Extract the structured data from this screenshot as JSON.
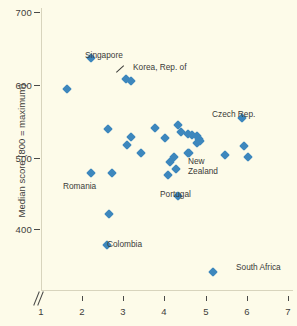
{
  "chart_data": {
    "type": "scatter",
    "title": "",
    "xlabel": "",
    "ylabel": "Median score (800 = maximum)",
    "xlim": [
      1,
      7
    ],
    "ylim": [
      330,
      700
    ],
    "grid": false,
    "legend": "none",
    "axis_break_x": true,
    "xticks": [
      1,
      2,
      3,
      4,
      5,
      6,
      7
    ],
    "yticks": [
      400,
      500,
      600,
      700
    ],
    "marker_color": "#3d87bd",
    "background_color": "#fdfbe9",
    "points": [
      {
        "x": 1.62,
        "y": 593,
        "label": ""
      },
      {
        "x": 2.22,
        "y": 637,
        "label": "Singapore"
      },
      {
        "x": 3.06,
        "y": 607,
        "label": "Korea, Rep. of"
      },
      {
        "x": 3.18,
        "y": 605,
        "label": ""
      },
      {
        "x": 5.88,
        "y": 553,
        "label": "Czech Rep."
      },
      {
        "x": 4.33,
        "y": 544,
        "label": ""
      },
      {
        "x": 3.78,
        "y": 539,
        "label": ""
      },
      {
        "x": 2.63,
        "y": 538,
        "label": ""
      },
      {
        "x": 4.41,
        "y": 534,
        "label": ""
      },
      {
        "x": 4.57,
        "y": 531,
        "label": ""
      },
      {
        "x": 4.67,
        "y": 530,
        "label": ""
      },
      {
        "x": 4.8,
        "y": 528,
        "label": ""
      },
      {
        "x": 4.83,
        "y": 524,
        "label": ""
      },
      {
        "x": 4.86,
        "y": 521,
        "label": ""
      },
      {
        "x": 3.18,
        "y": 527,
        "label": ""
      },
      {
        "x": 4.02,
        "y": 526,
        "label": ""
      },
      {
        "x": 4.78,
        "y": 519,
        "label": ""
      },
      {
        "x": 5.92,
        "y": 515,
        "label": ""
      },
      {
        "x": 3.1,
        "y": 516,
        "label": ""
      },
      {
        "x": 3.42,
        "y": 505,
        "label": ""
      },
      {
        "x": 4.58,
        "y": 505,
        "label": ""
      },
      {
        "x": 5.47,
        "y": 503,
        "label": ""
      },
      {
        "x": 6.02,
        "y": 500,
        "label": ""
      },
      {
        "x": 4.22,
        "y": 500,
        "label": ""
      },
      {
        "x": 4.14,
        "y": 493,
        "label": ""
      },
      {
        "x": 4.28,
        "y": 483,
        "label": ""
      },
      {
        "x": 2.22,
        "y": 477,
        "label": "Romania"
      },
      {
        "x": 2.72,
        "y": 478,
        "label": ""
      },
      {
        "x": 4.08,
        "y": 474,
        "label": ""
      },
      {
        "x": 4.33,
        "y": 446,
        "label": "Portugal"
      },
      {
        "x": 2.64,
        "y": 421,
        "label": ""
      },
      {
        "x": 2.6,
        "y": 378,
        "label": "Colombia"
      },
      {
        "x": 5.18,
        "y": 341,
        "label": "South Africa"
      },
      {
        "x": 4.6,
        "y": 505,
        "label": "New Zealand"
      }
    ],
    "annotations": [
      {
        "text": "Singapore",
        "x": 2.22,
        "y": 637
      },
      {
        "text": "Korea, Rep. of",
        "x": 3.06,
        "y": 607
      },
      {
        "text": "Czech Rep.",
        "x": 5.88,
        "y": 553
      },
      {
        "text": "New\nZealand",
        "x": 4.6,
        "y": 505
      },
      {
        "text": "Romania",
        "x": 2.22,
        "y": 477
      },
      {
        "text": "Portugal",
        "x": 4.33,
        "y": 446
      },
      {
        "text": "Colombia",
        "x": 2.6,
        "y": 378
      },
      {
        "text": "South Africa",
        "x": 5.18,
        "y": 341
      }
    ]
  },
  "axis": {
    "y_title": "Median score (800 = maximum)",
    "ylabels": [
      "700",
      "600",
      "500",
      "400"
    ],
    "xlabels": [
      "1",
      "2",
      "3",
      "4",
      "5",
      "6",
      "7"
    ]
  },
  "labels": {
    "singapore": "Singapore",
    "korea": "Korea, Rep. of",
    "czech": "Czech Rep.",
    "new_zealand_line1": "New",
    "new_zealand_line2": "Zealand",
    "romania": "Romania",
    "portugal": "Portugal",
    "colombia": "Colombia",
    "south_africa": "South Africa"
  }
}
